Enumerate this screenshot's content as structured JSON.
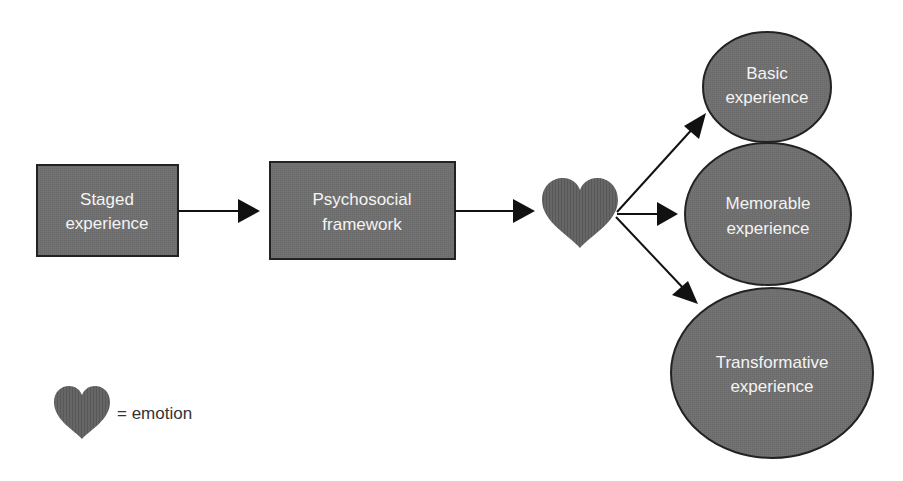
{
  "colors": {
    "node_fill": "#6e6e6e",
    "node_stroke": "#222222",
    "arrow": "#111111",
    "heart_fill": "#5c5c5c",
    "text_on_node": "#f4f4f4",
    "legend_text": "#333333",
    "background": "#ffffff"
  },
  "nodes": {
    "staged": {
      "line1": "Staged",
      "line2": "experience",
      "shape": "rectangle"
    },
    "psychosocial": {
      "line1": "Psychosocial",
      "line2": "framework",
      "shape": "rectangle"
    },
    "emotion": {
      "icon": "heart-icon",
      "shape": "heart"
    },
    "basic": {
      "line1": "Basic",
      "line2": "experience",
      "shape": "ellipse"
    },
    "memorable": {
      "line1": "Memorable",
      "line2": "experience",
      "shape": "ellipse"
    },
    "transformative": {
      "line1": "Transformative",
      "line2": "experience",
      "shape": "ellipse"
    }
  },
  "edges": [
    {
      "from": "staged",
      "to": "psychosocial"
    },
    {
      "from": "psychosocial",
      "to": "emotion"
    },
    {
      "from": "emotion",
      "to": "basic"
    },
    {
      "from": "emotion",
      "to": "memorable"
    },
    {
      "from": "emotion",
      "to": "transformative"
    }
  ],
  "legend": {
    "icon": "heart-icon",
    "label": "= emotion"
  }
}
